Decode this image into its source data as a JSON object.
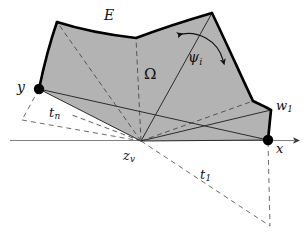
{
  "figure": {
    "caption_domain": "geometric-diagram",
    "background_color": "#ffffff",
    "surface_fill": "#b3b3b3",
    "outline_color": "#000000",
    "dashed_color": "#555555",
    "axis_color": "#777777",
    "labels": {
      "surface_E": "E",
      "angle_psi": "ψ",
      "angle_psi_sub": "i",
      "region_omega": "Ω",
      "vertex_y": "y",
      "vertex_w": "w",
      "vertex_w_sub": "1",
      "edge_tn": "t",
      "edge_tn_sub": "n",
      "apex_zv": "z",
      "apex_zv_sub": "v",
      "axis_x": "x",
      "edge_t1": "t",
      "edge_t1_sub": "1"
    },
    "geometry": {
      "apex_zv": [
        141,
        141
      ],
      "vertex_y": [
        39,
        89
      ],
      "vertex_x": [
        268,
        140
      ],
      "vertex_w1": [
        271,
        110
      ],
      "top_left": [
        57,
        22
      ],
      "top_valley": [
        136,
        38
      ],
      "top_right": [
        212,
        13
      ],
      "axis_start": [
        10,
        140
      ],
      "axis_end": [
        300,
        140
      ],
      "t1_far": [
        270,
        226
      ]
    }
  }
}
